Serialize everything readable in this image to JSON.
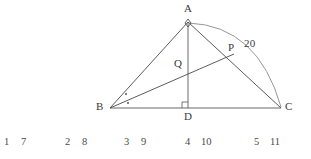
{
  "figure": {
    "type": "geometry-diagram",
    "colors": {
      "stroke_dark": "#444444",
      "stroke_base": "#9a9a9a",
      "stroke_arc": "#8a8a8a",
      "text": "#3a3a3a"
    },
    "points": [
      {
        "name": "A",
        "label": "A",
        "x": 188,
        "y": 22,
        "label_x": 184,
        "label_y": 3
      },
      {
        "name": "B",
        "label": "B",
        "x": 110,
        "y": 108,
        "label_x": 96,
        "label_y": 101
      },
      {
        "name": "C",
        "label": "C",
        "x": 281,
        "y": 108,
        "label_x": 285,
        "label_y": 101
      },
      {
        "name": "D",
        "label": "D",
        "x": 188,
        "y": 108,
        "label_x": 184,
        "label_y": 111
      },
      {
        "name": "P",
        "label": "P",
        "x": 234,
        "y": 54,
        "label_x": 228,
        "label_y": 42
      },
      {
        "name": "Q",
        "label": "Q",
        "x": 188,
        "y": 70,
        "label_x": 174,
        "label_y": 58
      }
    ],
    "segments": [
      {
        "name": "side-AB",
        "from": "A",
        "to": "B"
      },
      {
        "name": "side-AC",
        "from": "A",
        "to": "C"
      },
      {
        "name": "base-BC",
        "from": "B",
        "to": "C"
      },
      {
        "name": "altitude-AD",
        "from": "A",
        "to": "D"
      },
      {
        "name": "cevian-BP",
        "from": "B",
        "to": "P"
      }
    ],
    "arc": {
      "name": "arc-AC",
      "label": "20",
      "label_x": 244,
      "label_y": 38
    },
    "markers": [
      {
        "name": "right-angle-at-D",
        "kind": "right-angle-square"
      },
      {
        "name": "angle-bisector-dots-at-B",
        "kind": "equal-angle-dots",
        "count": 2
      },
      {
        "name": "angle-marker-at-A",
        "kind": "small-diamond"
      }
    ]
  },
  "number_row": {
    "name": "bottom-number-row",
    "items": [
      {
        "text": "1",
        "x": 4
      },
      {
        "text": "7",
        "x": 21
      },
      {
        "text": "2",
        "x": 65
      },
      {
        "text": "8",
        "x": 82
      },
      {
        "text": "3",
        "x": 124
      },
      {
        "text": "9",
        "x": 141
      },
      {
        "text": "4",
        "x": 185
      },
      {
        "text": "10",
        "x": 201
      },
      {
        "text": "5",
        "x": 254
      },
      {
        "text": "11",
        "x": 270
      }
    ]
  }
}
